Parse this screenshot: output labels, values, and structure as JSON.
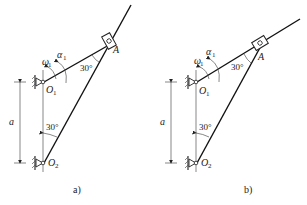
{
  "figure": {
    "panels": [
      {
        "caption": "a)",
        "labels": {
          "pivot_top": "O",
          "pivot_top_sub": "1",
          "pivot_bottom": "O",
          "pivot_bottom_sub": "2",
          "slider_point": "A",
          "omega": "ω",
          "omega_sub": "1",
          "alpha": "α",
          "alpha_sub": "1",
          "angle_at_A": "30°",
          "angle_at_O2": "30°",
          "distance": "a"
        }
      },
      {
        "caption": "b)",
        "labels": {
          "pivot_top": "O",
          "pivot_top_sub": "1",
          "pivot_bottom": "O",
          "pivot_bottom_sub": "2",
          "slider_point": "A",
          "omega": "ω",
          "omega_sub": "1",
          "alpha": "α",
          "alpha_sub": "1",
          "angle_at_A": "30°",
          "angle_at_O2": "30°",
          "distance": "a"
        }
      }
    ]
  }
}
